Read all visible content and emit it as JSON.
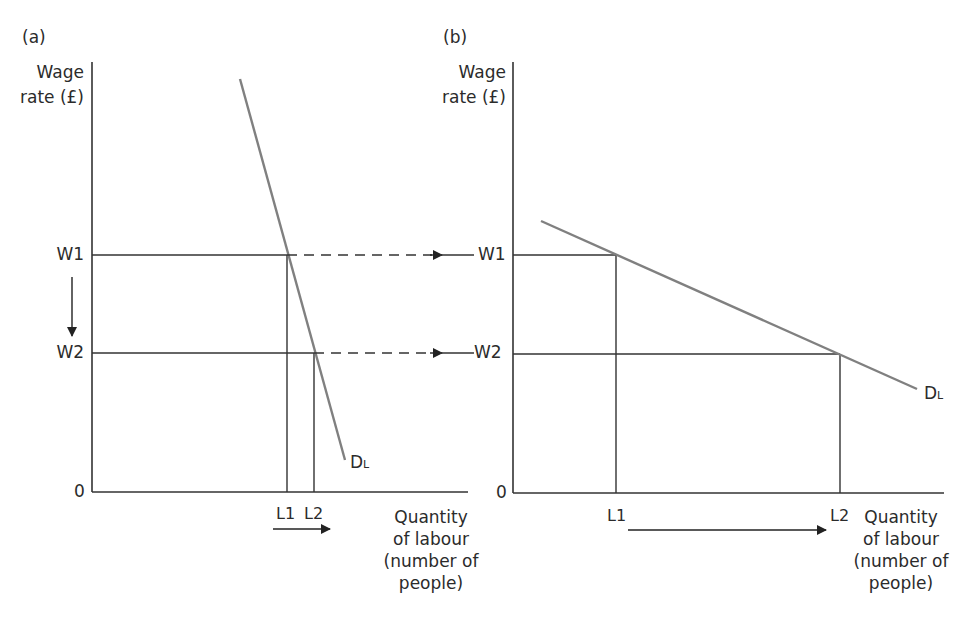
{
  "panel_a": {
    "label": "(a)",
    "y_axis_label_line1": "Wage",
    "y_axis_label_line2": "rate (£)",
    "origin": "0",
    "w1": "W1",
    "w2": "W2",
    "l1": "L1",
    "l2": "L2",
    "curve_label_main": "D",
    "curve_label_sub": "L",
    "x_axis_label_line1": "Quantity",
    "x_axis_label_line2": "of labour",
    "x_axis_label_line3": "(number of",
    "x_axis_label_line4": "people)"
  },
  "panel_b": {
    "label": "(b)",
    "y_axis_label_line1": "Wage",
    "y_axis_label_line2": "rate (£)",
    "origin": "0",
    "w1": "W1",
    "w2": "W2",
    "l1": "L1",
    "l2": "L2",
    "curve_label_main": "D",
    "curve_label_sub": "L",
    "x_axis_label_line1": "Quantity",
    "x_axis_label_line2": "of labour",
    "x_axis_label_line3": "(number of",
    "x_axis_label_line4": "people)"
  },
  "colors": {
    "axis": "#333333",
    "demand_curve": "#808080",
    "text": "#2b2b2b"
  }
}
